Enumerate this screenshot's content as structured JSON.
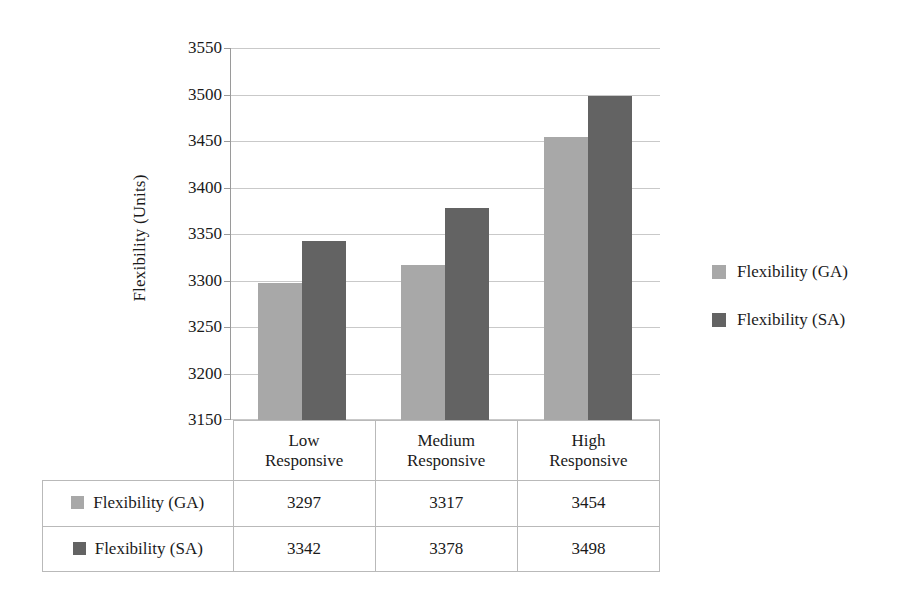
{
  "chart_data": {
    "type": "bar",
    "title": "",
    "xlabel": "",
    "ylabel": "Flexibility (Units)",
    "categories": [
      "Low Responsive",
      "Medium Responsive",
      "High Responsive"
    ],
    "category_lines": [
      [
        "Low",
        "Responsive"
      ],
      [
        "Medium",
        "Responsive"
      ],
      [
        "High",
        "Responsive"
      ]
    ],
    "series": [
      {
        "name": "Flexibility (GA)",
        "values": [
          3297,
          3317,
          3454
        ],
        "color": "#a8a8a8"
      },
      {
        "name": "Flexibility (SA)",
        "values": [
          3342,
          3378,
          3498
        ],
        "color": "#636363"
      }
    ],
    "ylim": [
      3150,
      3550
    ],
    "ytick_step": 50,
    "yticks": [
      3150,
      3200,
      3250,
      3300,
      3350,
      3400,
      3450,
      3500,
      3550
    ],
    "grid": true,
    "legend_position": "right",
    "data_table_visible": true
  },
  "legend": {
    "items": [
      {
        "label": "Flexibility (GA)",
        "color": "#a8a8a8"
      },
      {
        "label": "Flexibility (SA)",
        "color": "#636363"
      }
    ]
  },
  "table": {
    "row_headers": [
      "Flexibility (GA)",
      "Flexibility (SA)"
    ],
    "column_headers": [
      "Low Responsive",
      "Medium Responsive",
      "High Responsive"
    ],
    "rows": [
      {
        "label": "Flexibility (GA)",
        "cells": [
          "3297",
          "3317",
          "3454"
        ]
      },
      {
        "label": "Flexibility (SA)",
        "cells": [
          "3342",
          "3378",
          "3498"
        ]
      }
    ]
  },
  "axis": {
    "y_title": "Flexibility (Units)",
    "y_tick_labels": [
      "3550",
      "3500",
      "3450",
      "3400",
      "3350",
      "3300",
      "3250",
      "3200",
      "3150"
    ]
  }
}
